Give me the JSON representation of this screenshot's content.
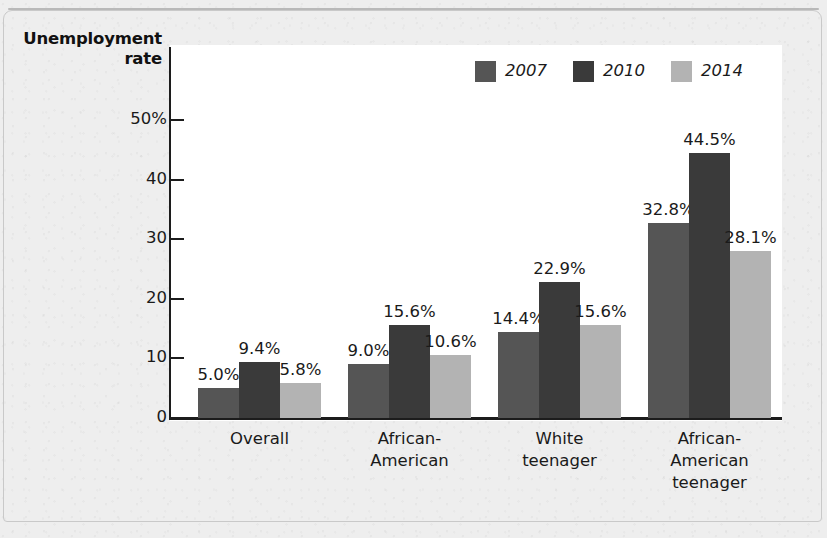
{
  "chart_data": {
    "type": "bar",
    "title": "",
    "ylabel": "Unemployment rate",
    "ylabel_lines": [
      "Unemployment",
      "rate"
    ],
    "xlabel": "",
    "ylim": [
      0,
      50
    ],
    "grid": false,
    "legend_position": "top-right",
    "y_ticks": [
      {
        "value": 50,
        "label": "50%"
      },
      {
        "value": 40,
        "label": "40"
      },
      {
        "value": 30,
        "label": "30"
      },
      {
        "value": 20,
        "label": "20"
      },
      {
        "value": 10,
        "label": "10"
      },
      {
        "value": 0,
        "label": "0"
      }
    ],
    "categories": [
      "Overall",
      "African-American",
      "White teenager",
      "African-American teenager"
    ],
    "category_label_lines": [
      [
        "Overall"
      ],
      [
        "African-",
        "American"
      ],
      [
        "White",
        "teenager"
      ],
      [
        "African-",
        "American",
        "teenager"
      ]
    ],
    "series": [
      {
        "name": "2007",
        "color": "#555555",
        "values": [
          5.0,
          9.0,
          14.4,
          32.8
        ],
        "labels": [
          "5.0%",
          "9.0%",
          "14.4%",
          "32.8%"
        ]
      },
      {
        "name": "2010",
        "color": "#3a3a3a",
        "values": [
          9.4,
          15.6,
          22.9,
          44.5
        ],
        "labels": [
          "9.4%",
          "15.6%",
          "22.9%",
          "44.5%"
        ]
      },
      {
        "name": "2014",
        "color": "#b3b3b3",
        "values": [
          5.8,
          10.6,
          15.6,
          28.1
        ],
        "labels": [
          "5.8%",
          "10.6%",
          "15.6%",
          "28.1%"
        ]
      }
    ]
  },
  "legend": {
    "items": [
      {
        "label": "2007",
        "color": "#555555"
      },
      {
        "label": "2010",
        "color": "#3a3a3a"
      },
      {
        "label": "2014",
        "color": "#b3b3b3"
      }
    ]
  },
  "colors": {
    "page_background": "#eeeeee",
    "plot_background": "#ffffff",
    "axis": "#1c1c1c",
    "text": "#1a1a1a",
    "series_2007": "#555555",
    "series_2010": "#3a3a3a",
    "series_2014": "#b3b3b3"
  }
}
